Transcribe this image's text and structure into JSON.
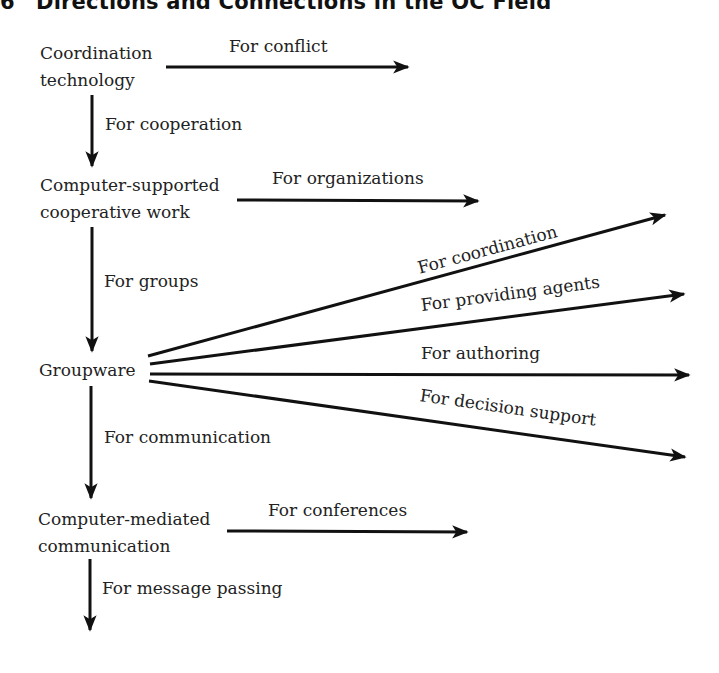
{
  "figure": {
    "number": "6",
    "title": "Directions and Connections in the OC Field"
  },
  "nodes": [
    {
      "id": "coordination-technology",
      "lines": [
        "Coordination",
        "technology"
      ]
    },
    {
      "id": "cscw",
      "lines": [
        "Computer-supported",
        "cooperative work"
      ]
    },
    {
      "id": "groupware",
      "lines": [
        "Groupware"
      ]
    },
    {
      "id": "cmc",
      "lines": [
        "Computer-mediated",
        "communication"
      ]
    }
  ],
  "edges": {
    "vertical": [
      {
        "label": "For cooperation",
        "from": "Coordination technology",
        "to": "Computer-supported cooperative work"
      },
      {
        "label": "For groups",
        "from": "Computer-supported cooperative work",
        "to": "Groupware"
      },
      {
        "label": "For communication",
        "from": "Groupware",
        "to": "Computer-mediated communication"
      },
      {
        "label": "For message passing",
        "from": "Computer-mediated communication",
        "to": ""
      }
    ],
    "horizontal": [
      {
        "label": "For conflict",
        "from": "Coordination technology"
      },
      {
        "label": "For organizations",
        "from": "Computer-supported cooperative work"
      },
      {
        "label": "For conferences",
        "from": "Computer-mediated communication"
      }
    ],
    "groupware_fan": [
      {
        "label": "For coordination"
      },
      {
        "label": "For providing agents"
      },
      {
        "label": "For authoring"
      },
      {
        "label": "For decision support"
      }
    ]
  }
}
